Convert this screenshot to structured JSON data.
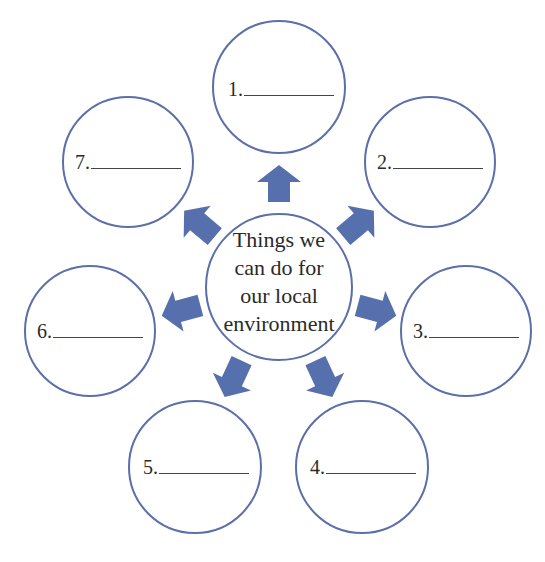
{
  "colors": {
    "circle_stroke": "#5b6fa8",
    "arrow_fill": "#5570ad",
    "text": "#2a2a2a",
    "background": "#ffffff"
  },
  "center": {
    "lines": [
      "Things we",
      "can do for",
      "our local",
      "environment"
    ]
  },
  "items": [
    {
      "number": "1.",
      "blank": "________"
    },
    {
      "number": "2.",
      "blank": "________"
    },
    {
      "number": "3.",
      "blank": "________"
    },
    {
      "number": "4.",
      "blank": "________"
    },
    {
      "number": "5.",
      "blank": "________"
    },
    {
      "number": "6.",
      "blank": "________"
    },
    {
      "number": "7.",
      "blank": "________"
    }
  ]
}
